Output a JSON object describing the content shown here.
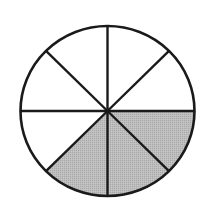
{
  "diagram": {
    "type": "fraction-circle",
    "total_sectors": 8,
    "shaded_sectors": 3,
    "center": [
      107.5,
      111
    ],
    "rx": 87,
    "ry": 85,
    "stroke_color": "#1a1a1a",
    "fill_color": "#b9b9b9",
    "background": "#ffffff",
    "shaded_sector_indices": [
      0,
      1,
      2
    ],
    "sector_note": "Sectors counted clockwise starting at the 3 o'clock radius; shaded: 0-45°, 45-90°, 90-135° (below horizontal, right and lower-left of bottom radius)"
  }
}
